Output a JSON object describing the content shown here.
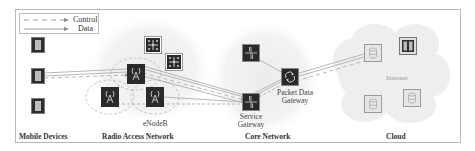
{
  "legend": {
    "control_label": "Control",
    "data_label": "Data"
  },
  "sections": {
    "mobile_devices": "Mobile Devices",
    "radio_access_network": "Radio Access Network",
    "core_network": "Core Network",
    "cloud": "Cloud"
  },
  "nodes": {
    "enodeb_label": "eNodeB",
    "service_gateway_line1": "Service",
    "service_gateway_line2": "Gateway",
    "pdn_gateway_line1": "Packet Data",
    "pdn_gateway_line2": "Gateway",
    "internet_label": "Internet"
  },
  "icons": {
    "mobile_device": "smartphone-icon",
    "enodeb": "cell-tower-icon",
    "ran_node": "network-hub-icon",
    "core_router": "router-cross-icon",
    "pdn_gateway": "gateway-cycle-icon",
    "cloud_server": "database-icon",
    "cloud_firewall": "server-rack-icon"
  },
  "colors": {
    "frame_border": "#b8b8b8",
    "node_fill_dark": "#2a2a2a",
    "node_border": "#8c8c8c",
    "region_fill": "#f1f1f1",
    "link_color": "#a6a6a6",
    "cloud_icon_fill": "#d9d9d9"
  }
}
